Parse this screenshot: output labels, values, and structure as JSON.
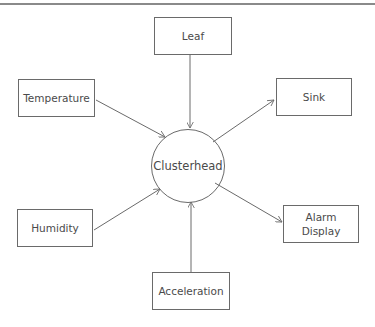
{
  "diagram": {
    "type": "star-topology",
    "stroke_color": "#6a6a6a",
    "text_color": "#4a4a4a",
    "center": {
      "label": "Clusterhead",
      "shape": "circle",
      "cx": 188,
      "cy": 166,
      "r": 37
    },
    "nodes": [
      {
        "id": "leaf",
        "label": "Leaf",
        "x": 154,
        "y": 17,
        "w": 78,
        "h": 38
      },
      {
        "id": "temperature",
        "label": "Temperature",
        "x": 18,
        "y": 79,
        "w": 77,
        "h": 38
      },
      {
        "id": "sink",
        "label": "Sink",
        "x": 276,
        "y": 78,
        "w": 76,
        "h": 38
      },
      {
        "id": "humidity",
        "label": "Humidity",
        "x": 17,
        "y": 209,
        "w": 76,
        "h": 38
      },
      {
        "id": "alarm-display",
        "label": "Alarm\nDisplay",
        "x": 283,
        "y": 205,
        "w": 76,
        "h": 38
      },
      {
        "id": "acceleration",
        "label": "Acceleration",
        "x": 152,
        "y": 272,
        "w": 78,
        "h": 38
      }
    ],
    "edges": [
      {
        "from": "leaf",
        "to": "clusterhead",
        "x1": 190,
        "y1": 55,
        "x2": 190,
        "y2": 128
      },
      {
        "from": "temperature",
        "to": "clusterhead",
        "x1": 96,
        "y1": 100,
        "x2": 165,
        "y2": 137
      },
      {
        "from": "clusterhead",
        "to": "sink",
        "x1": 213,
        "y1": 142,
        "x2": 274,
        "y2": 100
      },
      {
        "from": "humidity",
        "to": "clusterhead",
        "x1": 94,
        "y1": 230,
        "x2": 160,
        "y2": 189
      },
      {
        "from": "clusterhead",
        "to": "alarm-display",
        "x1": 215,
        "y1": 183,
        "x2": 282,
        "y2": 222
      },
      {
        "from": "acceleration",
        "to": "clusterhead",
        "x1": 191,
        "y1": 272,
        "x2": 191,
        "y2": 202
      }
    ]
  }
}
